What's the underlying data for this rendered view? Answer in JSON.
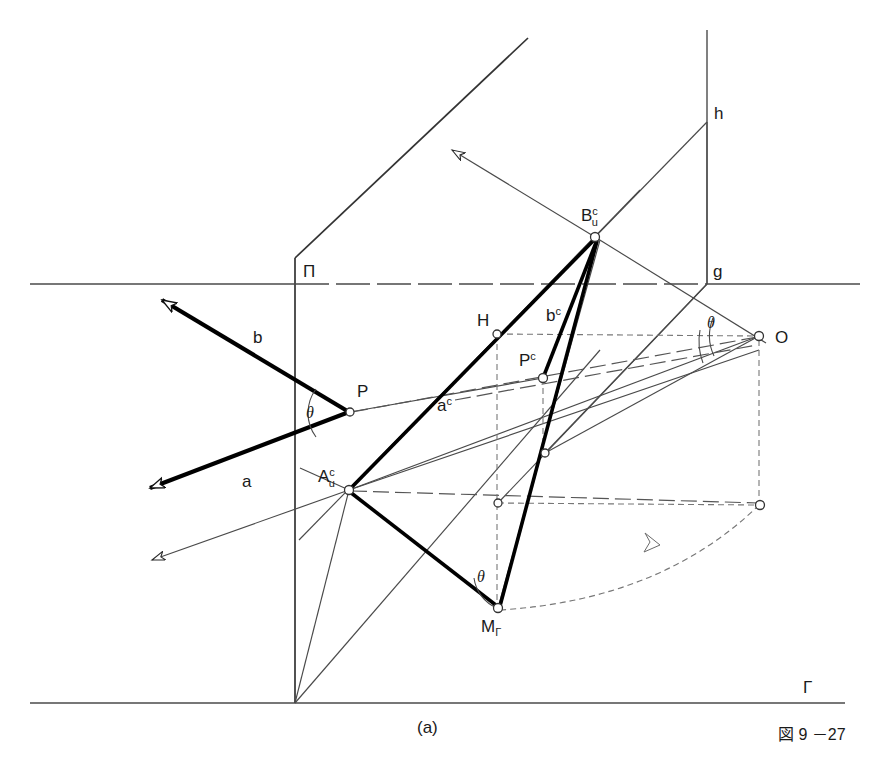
{
  "figure": {
    "caption": "(a)",
    "figure_number": "図 9 －27"
  },
  "colors": {
    "stroke_thin": "#4a4a4a",
    "stroke_thick": "#000000",
    "stroke_dashed": "#6b6b6b",
    "background": "#ffffff"
  },
  "labels": {
    "plane_pi": "Π",
    "ground_gamma": "Γ",
    "line_g": "g",
    "line_h": "h",
    "point_P": "P",
    "point_O": "O",
    "point_H": "H",
    "ray_a": "a",
    "ray_b": "b",
    "ray_ac_base": "a",
    "ray_ac_sup": "c",
    "ray_bc_base": "b",
    "ray_bc_sup": "c",
    "point_Pc_base": "P",
    "point_Pc_sup": "c",
    "point_A_base": "A",
    "point_A_sup": "c",
    "point_A_sub": "u",
    "point_B_base": "B",
    "point_B_sup": "c",
    "point_B_sub": "u",
    "point_M_base": "M",
    "point_M_sub": "Γ",
    "angle_theta_P": "θ",
    "angle_theta_O": "θ",
    "angle_theta_M": "θ"
  },
  "geometry": {
    "points": {
      "P": {
        "x": 350,
        "y": 412
      },
      "O": {
        "x": 759,
        "y": 336
      },
      "H": {
        "x": 497,
        "y": 334
      },
      "Pc": {
        "x": 543,
        "y": 378
      },
      "Au": {
        "x": 349,
        "y": 490
      },
      "Bu": {
        "x": 595,
        "y": 237
      },
      "Mg": {
        "x": 498,
        "y": 608
      },
      "N1": {
        "x": 545,
        "y": 453
      },
      "N2": {
        "x": 498,
        "y": 503
      },
      "Q": {
        "x": 760,
        "y": 505
      }
    },
    "lines": {
      "pi_vertical_x": 295,
      "pi_top_y": 258,
      "pi_bottom_y": 703,
      "pi_apex": {
        "x": 528,
        "y": 38
      },
      "horizontal_y": 284,
      "horizontal_x_start": 30,
      "horizontal_x_end": 860,
      "gamma_y": 703,
      "gamma_x_start": 30,
      "gamma_x_end": 845,
      "h_x": 707,
      "h_top_y": 30,
      "h_bottom_y": 284
    }
  }
}
